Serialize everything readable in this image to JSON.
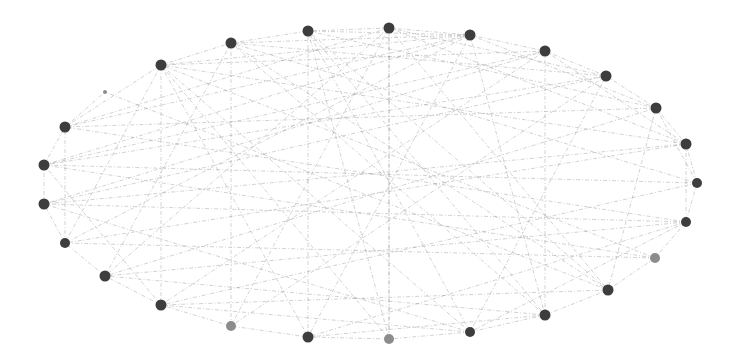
{
  "graph": {
    "layout": "circular-ellipse",
    "background": "#ffffff",
    "edge_color": "#8a8a8a",
    "node_color_default": "#3d3d3d",
    "node_color_light": "#8c8c8c",
    "nodes": [
      {
        "id": 0,
        "x": 389,
        "y": 28,
        "r": 5.5,
        "tone": "dark"
      },
      {
        "id": 1,
        "x": 470,
        "y": 35,
        "r": 5.5,
        "tone": "dark"
      },
      {
        "id": 2,
        "x": 545,
        "y": 51,
        "r": 5.5,
        "tone": "dark"
      },
      {
        "id": 3,
        "x": 606,
        "y": 76,
        "r": 5.5,
        "tone": "dark"
      },
      {
        "id": 4,
        "x": 656,
        "y": 108,
        "r": 5.5,
        "tone": "dark"
      },
      {
        "id": 5,
        "x": 686,
        "y": 144,
        "r": 5.5,
        "tone": "dark"
      },
      {
        "id": 6,
        "x": 697,
        "y": 183,
        "r": 5,
        "tone": "dark"
      },
      {
        "id": 7,
        "x": 686,
        "y": 222,
        "r": 5,
        "tone": "dark"
      },
      {
        "id": 8,
        "x": 655,
        "y": 258,
        "r": 5,
        "tone": "light"
      },
      {
        "id": 9,
        "x": 608,
        "y": 290,
        "r": 5.5,
        "tone": "dark"
      },
      {
        "id": 10,
        "x": 545,
        "y": 315,
        "r": 5.5,
        "tone": "dark"
      },
      {
        "id": 11,
        "x": 470,
        "y": 332,
        "r": 5,
        "tone": "dark"
      },
      {
        "id": 12,
        "x": 389,
        "y": 339,
        "r": 5,
        "tone": "light"
      },
      {
        "id": 13,
        "x": 308,
        "y": 337,
        "r": 5.5,
        "tone": "dark"
      },
      {
        "id": 14,
        "x": 231,
        "y": 326,
        "r": 5,
        "tone": "light"
      },
      {
        "id": 15,
        "x": 161,
        "y": 305,
        "r": 5.5,
        "tone": "dark"
      },
      {
        "id": 16,
        "x": 105,
        "y": 276,
        "r": 5.5,
        "tone": "dark"
      },
      {
        "id": 17,
        "x": 65,
        "y": 243,
        "r": 5,
        "tone": "dark"
      },
      {
        "id": 18,
        "x": 44,
        "y": 204,
        "r": 5.5,
        "tone": "dark"
      },
      {
        "id": 19,
        "x": 44,
        "y": 165,
        "r": 5.5,
        "tone": "dark"
      },
      {
        "id": 20,
        "x": 65,
        "y": 127,
        "r": 5.5,
        "tone": "dark"
      },
      {
        "id": 21,
        "x": 105,
        "y": 92,
        "r": 2,
        "tone": "light"
      },
      {
        "id": 22,
        "x": 161,
        "y": 65,
        "r": 5.5,
        "tone": "dark"
      },
      {
        "id": 23,
        "x": 231,
        "y": 43,
        "r": 5.5,
        "tone": "dark"
      },
      {
        "id": 24,
        "x": 308,
        "y": 31,
        "r": 5.5,
        "tone": "dark"
      }
    ],
    "edges": [
      [
        0,
        1
      ],
      [
        0,
        24
      ],
      [
        0,
        3
      ],
      [
        0,
        12
      ],
      [
        0,
        9
      ],
      [
        0,
        16
      ],
      [
        0,
        20
      ],
      [
        0,
        5
      ],
      [
        1,
        2
      ],
      [
        1,
        24
      ],
      [
        1,
        23
      ],
      [
        1,
        4
      ],
      [
        1,
        13
      ],
      [
        1,
        17
      ],
      [
        1,
        19
      ],
      [
        1,
        22
      ],
      [
        1,
        10
      ],
      [
        2,
        3
      ],
      [
        2,
        10
      ],
      [
        2,
        18
      ],
      [
        2,
        22
      ],
      [
        2,
        15
      ],
      [
        2,
        5
      ],
      [
        3,
        4
      ],
      [
        3,
        11
      ],
      [
        3,
        19
      ],
      [
        3,
        14
      ],
      [
        3,
        23
      ],
      [
        4,
        5
      ],
      [
        4,
        9
      ],
      [
        4,
        20
      ],
      [
        4,
        16
      ],
      [
        4,
        24
      ],
      [
        4,
        6
      ],
      [
        5,
        6
      ],
      [
        5,
        18
      ],
      [
        5,
        22
      ],
      [
        5,
        17
      ],
      [
        5,
        7
      ],
      [
        6,
        7
      ],
      [
        6,
        19
      ],
      [
        6,
        23
      ],
      [
        6,
        15
      ],
      [
        7,
        8
      ],
      [
        7,
        18
      ],
      [
        7,
        13
      ],
      [
        7,
        16
      ],
      [
        7,
        20
      ],
      [
        7,
        11
      ],
      [
        8,
        9
      ],
      [
        8,
        17
      ],
      [
        8,
        22
      ],
      [
        8,
        19
      ],
      [
        9,
        10
      ],
      [
        9,
        21
      ],
      [
        9,
        24
      ],
      [
        9,
        15
      ],
      [
        10,
        11
      ],
      [
        10,
        23
      ],
      [
        10,
        16
      ],
      [
        10,
        13
      ],
      [
        11,
        12
      ],
      [
        11,
        24
      ],
      [
        11,
        18
      ],
      [
        11,
        15
      ],
      [
        12,
        13
      ],
      [
        12,
        0
      ],
      [
        13,
        14
      ],
      [
        13,
        22
      ],
      [
        13,
        24
      ],
      [
        14,
        15
      ],
      [
        14,
        0
      ],
      [
        14,
        23
      ],
      [
        15,
        16
      ],
      [
        15,
        22
      ],
      [
        15,
        19
      ],
      [
        16,
        17
      ],
      [
        16,
        23
      ],
      [
        17,
        18
      ],
      [
        17,
        22
      ],
      [
        17,
        20
      ],
      [
        18,
        19
      ],
      [
        18,
        3
      ],
      [
        19,
        20
      ],
      [
        19,
        2
      ],
      [
        20,
        21
      ],
      [
        20,
        22
      ],
      [
        20,
        1
      ],
      [
        22,
        23
      ],
      [
        22,
        12
      ],
      [
        22,
        11
      ],
      [
        23,
        24
      ],
      [
        23,
        9
      ],
      [
        24,
        12
      ],
      [
        24,
        10
      ]
    ]
  }
}
